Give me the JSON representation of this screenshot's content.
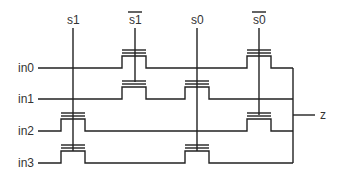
{
  "diagram": {
    "select_signals": [
      {
        "label": "s1",
        "overbar": false,
        "x": 73,
        "y_end": 151
      },
      {
        "label": "s1",
        "overbar": true,
        "x": 135,
        "y_end": 82
      },
      {
        "label": "s0",
        "overbar": false,
        "x": 197,
        "y_end": 151
      },
      {
        "label": "s0",
        "overbar": true,
        "x": 259,
        "y_end": 115
      }
    ],
    "inputs": [
      {
        "label": "in0",
        "y": 68,
        "transistors": [
          "s1bar",
          "s0bar"
        ]
      },
      {
        "label": "in1",
        "y": 99,
        "transistors": [
          "s1bar",
          "s0"
        ]
      },
      {
        "label": "in2",
        "y": 131,
        "transistors": [
          "s1",
          "s0bar"
        ]
      },
      {
        "label": "in3",
        "y": 163,
        "transistors": [
          "s1",
          "s0"
        ]
      }
    ],
    "output": {
      "label": "z",
      "y": 115
    },
    "colors": {
      "line": "#222222",
      "text": "#333333",
      "background": "#ffffff"
    }
  }
}
